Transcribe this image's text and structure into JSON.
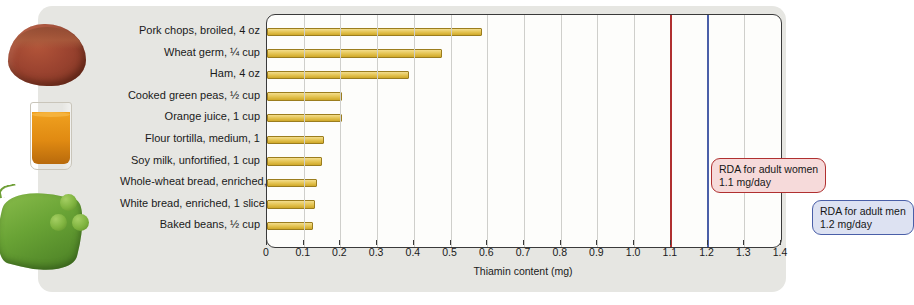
{
  "chart_data": {
    "type": "bar",
    "orientation": "horizontal",
    "title": "",
    "xlabel": "Thiamin content (mg)",
    "ylabel": "",
    "xlim": [
      0,
      1.4
    ],
    "xticks": [
      "0",
      "0.1",
      "0.2",
      "0.3",
      "0.4",
      "0.5",
      "0.6",
      "0.7",
      "0.8",
      "0.9",
      "1.0",
      "1.1",
      "1.2",
      "1.3",
      "1.4"
    ],
    "grid": true,
    "legend": "none",
    "categories": [
      "Pork chops, broiled, 4 oz",
      "Wheat germ, ¼ cup",
      "Ham, 4 oz",
      "Cooked green peas, ½ cup",
      "Orange juice, 1 cup",
      "Flour tortilla, medium, 1",
      "Soy milk, unfortified, 1 cup",
      "Whole-wheat bread, enriched, 1 slice",
      "White bread, enriched, 1 slice",
      "Baked beans, ½ cup"
    ],
    "values": [
      0.58,
      0.47,
      0.38,
      0.2,
      0.2,
      0.15,
      0.145,
      0.13,
      0.125,
      0.12
    ],
    "bar_color": "#e3c24f",
    "annotations": [
      {
        "name": "rda-women",
        "value": 1.1,
        "label_line1": "RDA for adult women",
        "label_line2": "1.1 mg/day",
        "color": "#b03030"
      },
      {
        "name": "rda-men",
        "value": 1.2,
        "label_line1": "RDA for adult men",
        "label_line2": "1.2 mg/day",
        "color": "#4a5fa8"
      }
    ]
  },
  "images": [
    {
      "name": "ham-photo",
      "alt": "slice of ham"
    },
    {
      "name": "orange-juice-photo",
      "alt": "glass of orange juice"
    },
    {
      "name": "green-peas-photo",
      "alt": "pea pod with green peas"
    }
  ]
}
